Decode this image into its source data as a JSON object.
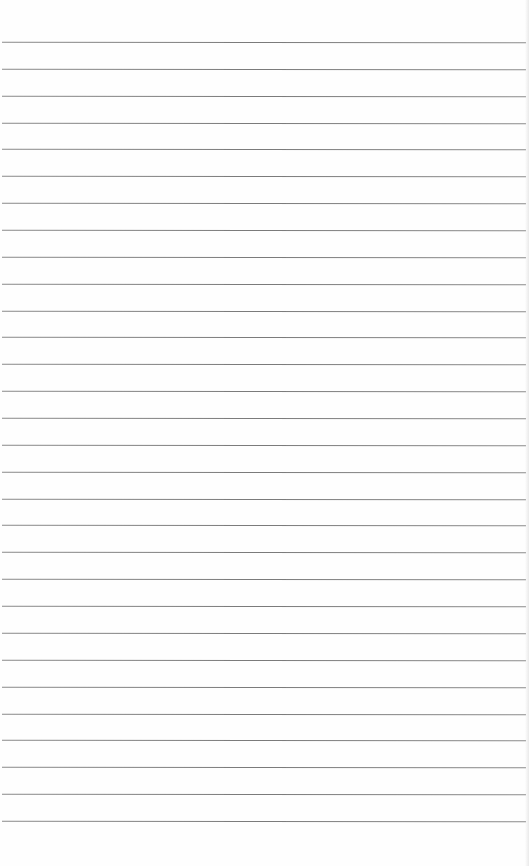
{
  "page": {
    "type": "lined-paper",
    "background_color": "#ffffff",
    "line_color": "#7f7f7f",
    "line_count": 30,
    "first_line_y": 42,
    "line_spacing": 26.86
  }
}
